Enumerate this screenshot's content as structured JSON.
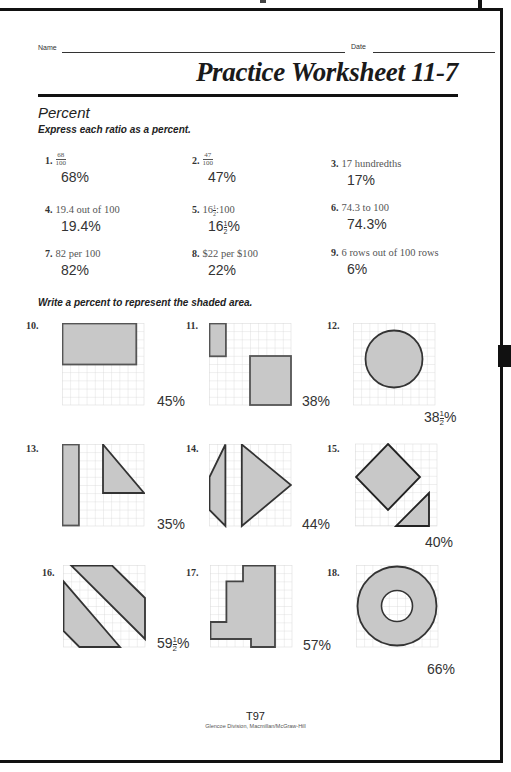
{
  "header": {
    "name_label": "Name",
    "date_label": "Date",
    "title": "Practice Worksheet 11-7",
    "section": "Percent"
  },
  "part1": {
    "instruction": "Express each ratio as a percent.",
    "problems": [
      {
        "number": "1.",
        "question_fraction": {
          "num": "68",
          "den": "100"
        },
        "answer": "68%"
      },
      {
        "number": "2.",
        "question_fraction": {
          "num": "47",
          "den": "100"
        },
        "answer": "47%"
      },
      {
        "number": "3.",
        "question": "17 hundredths",
        "answer": "17%"
      },
      {
        "number": "4.",
        "question": "19.4 out of 100",
        "answer": "19.4%"
      },
      {
        "number": "5.",
        "question_whole": "16",
        "question_half": {
          "num": "1",
          "den": "2"
        },
        "question_rest": ":100",
        "answer_whole": "16",
        "answer_half": {
          "num": "1",
          "den": "2"
        },
        "answer_suffix": "%"
      },
      {
        "number": "6.",
        "question": "74.3 to 100",
        "answer": "74.3%"
      },
      {
        "number": "7.",
        "question": "82 per 100",
        "answer": "82%"
      },
      {
        "number": "8.",
        "question": "$22 per $100",
        "answer": "22%"
      },
      {
        "number": "9.",
        "question": "6 rows out of 100 rows",
        "answer": "6%"
      }
    ]
  },
  "part2": {
    "instruction": "Write a percent to represent the shaded area.",
    "figures": [
      {
        "number": "10.",
        "answer": "45%",
        "shape": "rectangle"
      },
      {
        "number": "11.",
        "answer": "38%",
        "shape": "two-rectangles"
      },
      {
        "number": "12.",
        "answer_whole": "38",
        "answer_half": {
          "num": "1",
          "den": "2"
        },
        "answer_suffix": "%",
        "shape": "circle"
      },
      {
        "number": "13.",
        "answer": "35%",
        "shape": "bar-and-triangle"
      },
      {
        "number": "14.",
        "answer": "44%",
        "shape": "trapezoid-and-triangle"
      },
      {
        "number": "15.",
        "answer": "40%",
        "shape": "diamond-and-triangle"
      },
      {
        "number": "16.",
        "answer_whole": "59",
        "answer_half": {
          "num": "1",
          "den": "2"
        },
        "answer_suffix": "%",
        "shape": "diagonal-bands"
      },
      {
        "number": "17.",
        "answer": "57%",
        "shape": "stepped-polygon"
      },
      {
        "number": "18.",
        "answer": "66%",
        "shape": "annulus"
      }
    ]
  },
  "footer": {
    "page": "T97",
    "publisher": "Glencoe Division, Macmillan/McGraw-Hill"
  },
  "colors": {
    "shade": "#c8c8c8",
    "grid": "#d4d4d4",
    "outline": "#333333"
  }
}
